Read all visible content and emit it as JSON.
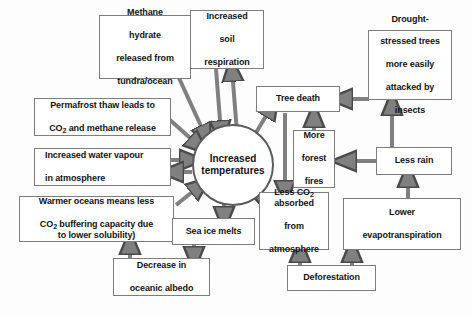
{
  "diagram": {
    "background_color": "#fdfdfd",
    "arrow_fill": "#808080",
    "arrow_stroke": "#4a4a4a",
    "box_border_color": "#7d7d7d",
    "text_color": "#131313",
    "hub": {
      "label_line1": "Increased",
      "label_line2": "temperatures"
    },
    "nodes": [
      {
        "id": "methane-hydrate",
        "lines": [
          "Methane",
          "hydrate",
          "released from",
          "tundra/ocean"
        ]
      },
      {
        "id": "soil-respiration",
        "lines": [
          "Increased",
          "soil",
          "respiration"
        ]
      },
      {
        "id": "drought-stressed-trees",
        "lines": [
          "Drought-",
          "stressed trees",
          "more easily",
          "attacked by",
          "insects"
        ]
      },
      {
        "id": "permafrost-thaw",
        "lines": [
          "Permafrost thaw leads to",
          "CO2 and methane release"
        ]
      },
      {
        "id": "tree-death",
        "lines": [
          "Tree death"
        ]
      },
      {
        "id": "water-vapour",
        "lines": [
          "Increased water vapour",
          "in atmosphere"
        ]
      },
      {
        "id": "forest-fires",
        "lines": [
          "More",
          "forest",
          "fires"
        ]
      },
      {
        "id": "less-rain",
        "lines": [
          "Less rain"
        ]
      },
      {
        "id": "warmer-oceans",
        "lines": [
          "Warmer oceans means less",
          "CO2 buffering capacity due",
          "to lower solubility)"
        ]
      },
      {
        "id": "sea-ice-melts",
        "lines": [
          "Sea ice melts"
        ]
      },
      {
        "id": "less-co2-absorbed",
        "lines": [
          "Less CO2",
          "absorbed",
          "from",
          "atmosphere"
        ]
      },
      {
        "id": "lower-evapotranspiration",
        "lines": [
          "Lower",
          "evapotranspiration"
        ]
      },
      {
        "id": "oceanic-albedo",
        "lines": [
          "Decrease in",
          "oceanic albedo"
        ]
      },
      {
        "id": "deforestation",
        "lines": [
          "Deforestation"
        ]
      }
    ],
    "edges": [
      {
        "from": "methane-hydrate",
        "to": "hub",
        "direction": "to-hub"
      },
      {
        "from": "permafrost-thaw",
        "to": "hub",
        "direction": "to-hub"
      },
      {
        "from": "water-vapour",
        "to": "hub",
        "direction": "bidirectional"
      },
      {
        "from": "warmer-oceans",
        "to": "hub",
        "direction": "to-hub"
      },
      {
        "from": "soil-respiration",
        "to": "hub",
        "direction": "bidirectional"
      },
      {
        "from": "hub",
        "to": "sea-ice-melts",
        "direction": "from-hub"
      },
      {
        "from": "sea-ice-melts",
        "to": "oceanic-albedo",
        "direction": "from-hub"
      },
      {
        "from": "oceanic-albedo",
        "to": "warmer-oceans",
        "direction": "to-hub"
      },
      {
        "from": "hub",
        "to": "tree-death",
        "direction": "from-hub"
      },
      {
        "from": "tree-death",
        "to": "less-co2-absorbed",
        "direction": "from-hub"
      },
      {
        "from": "less-co2-absorbed",
        "to": "hub",
        "direction": "to-hub"
      },
      {
        "from": "forest-fires",
        "to": "tree-death",
        "direction": "to-hub"
      },
      {
        "from": "less-rain",
        "to": "forest-fires",
        "direction": "to-hub"
      },
      {
        "from": "less-rain",
        "to": "drought-stressed-trees",
        "direction": "to-hub"
      },
      {
        "from": "drought-stressed-trees",
        "to": "tree-death",
        "direction": "to-hub"
      },
      {
        "from": "lower-evapotranspiration",
        "to": "less-rain",
        "direction": "to-hub"
      },
      {
        "from": "deforestation",
        "to": "less-co2-absorbed",
        "direction": "to-hub"
      },
      {
        "from": "deforestation",
        "to": "lower-evapotranspiration",
        "direction": "to-hub"
      }
    ]
  }
}
